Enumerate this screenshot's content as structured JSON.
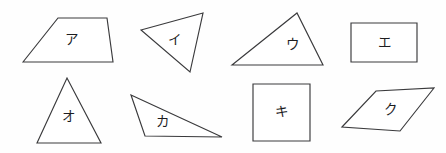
{
  "sheet": {
    "title": "Geometric shapes figure",
    "background_color": "#fefefe",
    "stroke_color": "#3a3a3c",
    "label_color": "#1d1d1f",
    "width": 446,
    "height": 153
  },
  "shapes": [
    {
      "id": "shape-a",
      "label": "ア",
      "label_romaji": "a",
      "kind": "trapezoid",
      "row": "top",
      "position": 1,
      "points": "23,62 58,18 107,18 113,62",
      "label_x": 71,
      "label_y": 40
    },
    {
      "id": "shape-i",
      "label": "イ",
      "label_romaji": "i",
      "kind": "triangle",
      "row": "top",
      "position": 2,
      "points": "141,30 203,13 190,72",
      "label_x": 174,
      "label_y": 40
    },
    {
      "id": "shape-u",
      "label": "ウ",
      "label_romaji": "u",
      "kind": "triangle",
      "row": "top",
      "position": 3,
      "points": "232,65 297,13 323,65",
      "label_x": 292,
      "label_y": 45
    },
    {
      "id": "shape-e",
      "label": "エ",
      "label_romaji": "e",
      "kind": "rectangle",
      "row": "top",
      "position": 4,
      "points": "351,23 417,23 417,62 351,62",
      "label_x": 384,
      "label_y": 43
    },
    {
      "id": "shape-o",
      "label": "オ",
      "label_romaji": "o",
      "kind": "triangle",
      "row": "bottom",
      "position": 1,
      "points": "37,143 67,78 101,143",
      "label_x": 68,
      "label_y": 117
    },
    {
      "id": "shape-ka",
      "label": "カ",
      "label_romaji": "ka",
      "kind": "triangle",
      "row": "bottom",
      "position": 2,
      "points": "131,95 222,137 145,136",
      "label_x": 162,
      "label_y": 122
    },
    {
      "id": "shape-ki",
      "label": "キ",
      "label_romaji": "ki",
      "kind": "square",
      "row": "bottom",
      "position": 3,
      "points": "253,84 310,84 310,141 253,141",
      "label_x": 281,
      "label_y": 112
    },
    {
      "id": "shape-ku",
      "label": "ク",
      "label_romaji": "ku",
      "kind": "parallelogram",
      "row": "bottom",
      "position": 4,
      "points": "342,127 376,91 434,88 400,131",
      "label_x": 390,
      "label_y": 110
    }
  ]
}
